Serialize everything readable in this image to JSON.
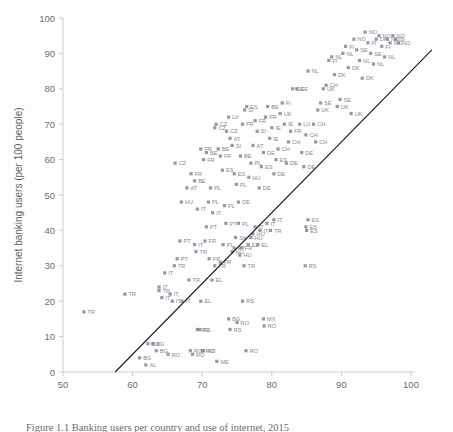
{
  "figure": {
    "caption": "Figure 1.1 Banking users per country and use of internet, 2015"
  },
  "chart_data": {
    "type": "scatter",
    "title": "",
    "xlabel": "Internet users (per 100 people)",
    "ylabel": "Internet banking users (per 100 people)",
    "xlim": [
      50,
      100
    ],
    "ylim": [
      0,
      100
    ],
    "xticks": [
      50,
      60,
      70,
      80,
      90,
      100
    ],
    "yticks": [
      0,
      10,
      20,
      30,
      40,
      50,
      60,
      70,
      80,
      90,
      100
    ],
    "grid": false,
    "legend": "none",
    "marker_color": "#7b8a9e",
    "trendline_color": "#1a1a1a",
    "trendline": {
      "x0": 57.5,
      "y0": 0,
      "x1": 103.0,
      "y1": 91.0
    },
    "points": [
      {
        "x": 53.0,
        "y": 17,
        "label": "TR"
      },
      {
        "x": 58.9,
        "y": 22,
        "label": "TR"
      },
      {
        "x": 61.0,
        "y": 4,
        "label": "BG"
      },
      {
        "x": 61.9,
        "y": 2,
        "label": "AL"
      },
      {
        "x": 62.2,
        "y": 8,
        "label": "BG"
      },
      {
        "x": 62.9,
        "y": 8,
        "label": "BG"
      },
      {
        "x": 63.4,
        "y": 6,
        "label": "BG"
      },
      {
        "x": 63.8,
        "y": 24,
        "label": "IT"
      },
      {
        "x": 63.8,
        "y": 23,
        "label": "TR"
      },
      {
        "x": 64.2,
        "y": 21,
        "label": "IT"
      },
      {
        "x": 64.6,
        "y": 28,
        "label": "IT"
      },
      {
        "x": 65.1,
        "y": 5,
        "label": "RO"
      },
      {
        "x": 65.4,
        "y": 22,
        "label": "IT"
      },
      {
        "x": 65.7,
        "y": 20,
        "label": "IT"
      },
      {
        "x": 66.0,
        "y": 30,
        "label": "TR"
      },
      {
        "x": 66.4,
        "y": 32,
        "label": "PT"
      },
      {
        "x": 66.8,
        "y": 37,
        "label": "PT"
      },
      {
        "x": 67.1,
        "y": 20,
        "label": "IT"
      },
      {
        "x": 68.1,
        "y": 26,
        "label": "TR"
      },
      {
        "x": 68.3,
        "y": 6,
        "label": "RO"
      },
      {
        "x": 68.6,
        "y": 5,
        "label": "RO"
      },
      {
        "x": 68.9,
        "y": 36,
        "label": "IT"
      },
      {
        "x": 69.1,
        "y": 34,
        "label": "TR"
      },
      {
        "x": 69.3,
        "y": 12,
        "label": "RS"
      },
      {
        "x": 69.6,
        "y": 12,
        "label": "RS"
      },
      {
        "x": 69.8,
        "y": 20,
        "label": "EL"
      },
      {
        "x": 70.0,
        "y": 6,
        "label": "RO"
      },
      {
        "x": 70.2,
        "y": 6,
        "label": "RO"
      },
      {
        "x": 70.4,
        "y": 37,
        "label": "FR"
      },
      {
        "x": 70.6,
        "y": 41,
        "label": "PT"
      },
      {
        "x": 71.0,
        "y": 32,
        "label": "FR"
      },
      {
        "x": 71.4,
        "y": 26,
        "label": "EL"
      },
      {
        "x": 71.8,
        "y": 30,
        "label": "TR"
      },
      {
        "x": 72.1,
        "y": 3,
        "label": "ME"
      },
      {
        "x": 72.6,
        "y": 31,
        "label": "FR"
      },
      {
        "x": 73.0,
        "y": 36,
        "label": "PL"
      },
      {
        "x": 73.4,
        "y": 42,
        "label": "PT"
      },
      {
        "x": 73.8,
        "y": 15,
        "label": "BG"
      },
      {
        "x": 74.0,
        "y": 12,
        "label": "RS"
      },
      {
        "x": 74.3,
        "y": 34,
        "label": "HU"
      },
      {
        "x": 74.6,
        "y": 35,
        "label": "PT"
      },
      {
        "x": 74.8,
        "y": 38,
        "label": "SK"
      },
      {
        "x": 75.0,
        "y": 14,
        "label": "RO"
      },
      {
        "x": 75.2,
        "y": 42,
        "label": "PL"
      },
      {
        "x": 75.4,
        "y": 33,
        "label": "HU"
      },
      {
        "x": 75.6,
        "y": 35,
        "label": "FR"
      },
      {
        "x": 75.8,
        "y": 20,
        "label": "RS"
      },
      {
        "x": 76.0,
        "y": 30,
        "label": "TR"
      },
      {
        "x": 76.3,
        "y": 6,
        "label": "RO"
      },
      {
        "x": 76.6,
        "y": 36,
        "label": "EL"
      },
      {
        "x": 77.0,
        "y": 38,
        "label": "HU"
      },
      {
        "x": 77.3,
        "y": 39,
        "label": "HU"
      },
      {
        "x": 77.6,
        "y": 41,
        "label": "IT"
      },
      {
        "x": 78.0,
        "y": 36,
        "label": "EL"
      },
      {
        "x": 78.3,
        "y": 40,
        "label": "IT"
      },
      {
        "x": 78.8,
        "y": 15,
        "label": "MX"
      },
      {
        "x": 78.9,
        "y": 13,
        "label": "RO"
      },
      {
        "x": 79.3,
        "y": 42,
        "label": "IT"
      },
      {
        "x": 79.8,
        "y": 40,
        "label": "TR"
      },
      {
        "x": 80.3,
        "y": 43,
        "label": "IT"
      },
      {
        "x": 84.8,
        "y": 30,
        "label": "RS"
      },
      {
        "x": 84.9,
        "y": 41,
        "label": "ES"
      },
      {
        "x": 85.0,
        "y": 40,
        "label": "ES"
      },
      {
        "x": 85.2,
        "y": 43,
        "label": "ES"
      },
      {
        "x": 66.1,
        "y": 59,
        "label": "CZ"
      },
      {
        "x": 67.0,
        "y": 48,
        "label": "HU"
      },
      {
        "x": 67.8,
        "y": 52,
        "label": "AT"
      },
      {
        "x": 68.4,
        "y": 56,
        "label": "FR"
      },
      {
        "x": 68.9,
        "y": 54,
        "label": "BE"
      },
      {
        "x": 69.3,
        "y": 46,
        "label": "IT"
      },
      {
        "x": 69.8,
        "y": 63,
        "label": "FR"
      },
      {
        "x": 70.2,
        "y": 60,
        "label": "FR"
      },
      {
        "x": 70.6,
        "y": 62,
        "label": "BE"
      },
      {
        "x": 70.9,
        "y": 48,
        "label": "PL"
      },
      {
        "x": 71.2,
        "y": 52,
        "label": "PL"
      },
      {
        "x": 71.5,
        "y": 45,
        "label": "IT"
      },
      {
        "x": 71.8,
        "y": 69,
        "label": "CZ"
      },
      {
        "x": 72.0,
        "y": 70,
        "label": "CZ"
      },
      {
        "x": 72.3,
        "y": 63,
        "label": "BE"
      },
      {
        "x": 72.6,
        "y": 61,
        "label": "FR"
      },
      {
        "x": 72.9,
        "y": 57,
        "label": "ES"
      },
      {
        "x": 73.2,
        "y": 47,
        "label": "PL"
      },
      {
        "x": 73.5,
        "y": 68,
        "label": "CZ"
      },
      {
        "x": 73.8,
        "y": 72,
        "label": "LV"
      },
      {
        "x": 74.0,
        "y": 66,
        "label": "AT"
      },
      {
        "x": 74.3,
        "y": 64,
        "label": "SI"
      },
      {
        "x": 74.6,
        "y": 56,
        "label": "ES"
      },
      {
        "x": 74.9,
        "y": 53,
        "label": "PL"
      },
      {
        "x": 75.2,
        "y": 48,
        "label": "DE"
      },
      {
        "x": 75.5,
        "y": 61,
        "label": "BE"
      },
      {
        "x": 75.8,
        "y": 70,
        "label": "FR"
      },
      {
        "x": 76.1,
        "y": 74,
        "label": "SI"
      },
      {
        "x": 76.4,
        "y": 75,
        "label": "ES"
      },
      {
        "x": 76.7,
        "y": 55,
        "label": "HU"
      },
      {
        "x": 77.0,
        "y": 59,
        "label": "PL"
      },
      {
        "x": 77.3,
        "y": 64,
        "label": "AT"
      },
      {
        "x": 77.6,
        "y": 71,
        "label": "FR"
      },
      {
        "x": 77.9,
        "y": 68,
        "label": "SI"
      },
      {
        "x": 78.2,
        "y": 52,
        "label": "DE"
      },
      {
        "x": 78.5,
        "y": 58,
        "label": "ES"
      },
      {
        "x": 78.8,
        "y": 62,
        "label": "DE"
      },
      {
        "x": 79.1,
        "y": 72,
        "label": "FR"
      },
      {
        "x": 79.4,
        "y": 75,
        "label": "BE"
      },
      {
        "x": 79.7,
        "y": 66,
        "label": "IE"
      },
      {
        "x": 80.0,
        "y": 69,
        "label": "IE"
      },
      {
        "x": 80.3,
        "y": 56,
        "label": "DE"
      },
      {
        "x": 80.6,
        "y": 60,
        "label": "ES"
      },
      {
        "x": 80.9,
        "y": 63,
        "label": "CH"
      },
      {
        "x": 81.2,
        "y": 73,
        "label": "UK"
      },
      {
        "x": 81.5,
        "y": 76,
        "label": "FI"
      },
      {
        "x": 81.8,
        "y": 70,
        "label": "IE"
      },
      {
        "x": 82.1,
        "y": 59,
        "label": "DE"
      },
      {
        "x": 82.4,
        "y": 65,
        "label": "CH"
      },
      {
        "x": 82.7,
        "y": 68,
        "label": "FR"
      },
      {
        "x": 83.0,
        "y": 80,
        "label": "EE"
      },
      {
        "x": 83.6,
        "y": 80,
        "label": "SE"
      },
      {
        "x": 84.0,
        "y": 70,
        "label": "LU"
      },
      {
        "x": 84.3,
        "y": 62,
        "label": "DE"
      },
      {
        "x": 84.6,
        "y": 58,
        "label": "DE"
      },
      {
        "x": 84.9,
        "y": 67,
        "label": "CH"
      },
      {
        "x": 85.2,
        "y": 85,
        "label": "NL"
      },
      {
        "x": 86.0,
        "y": 70,
        "label": "CH"
      },
      {
        "x": 86.3,
        "y": 65,
        "label": "CH"
      },
      {
        "x": 86.6,
        "y": 74,
        "label": "UK"
      },
      {
        "x": 87.0,
        "y": 76,
        "label": "SE"
      },
      {
        "x": 87.4,
        "y": 80,
        "label": "UK"
      },
      {
        "x": 87.8,
        "y": 81,
        "label": "CH"
      },
      {
        "x": 88.2,
        "y": 88,
        "label": "FI"
      },
      {
        "x": 88.6,
        "y": 89,
        "label": "NL"
      },
      {
        "x": 89.0,
        "y": 84,
        "label": "DK"
      },
      {
        "x": 89.4,
        "y": 75,
        "label": "UK"
      },
      {
        "x": 89.8,
        "y": 77,
        "label": "SE"
      },
      {
        "x": 90.2,
        "y": 90,
        "label": "NL"
      },
      {
        "x": 90.6,
        "y": 92,
        "label": "FI"
      },
      {
        "x": 91.0,
        "y": 86,
        "label": "DK"
      },
      {
        "x": 91.4,
        "y": 73,
        "label": "UK"
      },
      {
        "x": 91.8,
        "y": 94,
        "label": "NO"
      },
      {
        "x": 92.2,
        "y": 91,
        "label": "SE"
      },
      {
        "x": 92.6,
        "y": 88,
        "label": "NL"
      },
      {
        "x": 93.0,
        "y": 83,
        "label": "DK"
      },
      {
        "x": 93.4,
        "y": 96,
        "label": "NO"
      },
      {
        "x": 93.8,
        "y": 93,
        "label": "FI"
      },
      {
        "x": 94.2,
        "y": 90,
        "label": "SE"
      },
      {
        "x": 94.6,
        "y": 87,
        "label": "NL"
      },
      {
        "x": 95.0,
        "y": 94,
        "label": "DK"
      },
      {
        "x": 95.4,
        "y": 95,
        "label": "NO"
      },
      {
        "x": 95.8,
        "y": 92,
        "label": "FI"
      },
      {
        "x": 96.2,
        "y": 89,
        "label": "NL"
      },
      {
        "x": 96.6,
        "y": 94,
        "label": "NO"
      },
      {
        "x": 97.0,
        "y": 93,
        "label": "NO"
      },
      {
        "x": 97.4,
        "y": 95,
        "label": "NO"
      },
      {
        "x": 97.8,
        "y": 94,
        "label": "IS"
      },
      {
        "x": 98.2,
        "y": 93,
        "label": "NO"
      }
    ]
  }
}
